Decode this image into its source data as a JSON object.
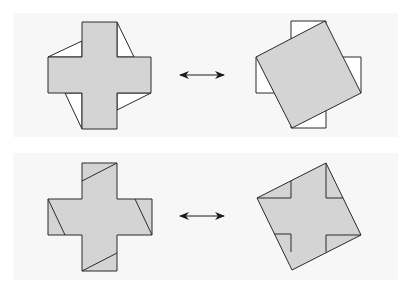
{
  "colors": {
    "fill": "#d4d4d4",
    "stroke": "#2a2a2a",
    "panel": "#f7f7f7",
    "background": "#ffffff"
  },
  "rows": [
    {
      "left": "greek-cross-with-triangles",
      "relation": "double-arrow",
      "right": "tilted-square-over-cross"
    },
    {
      "left": "greek-cross-with-cut-lines",
      "relation": "double-arrow",
      "right": "tilted-square-with-cross-lines"
    }
  ]
}
